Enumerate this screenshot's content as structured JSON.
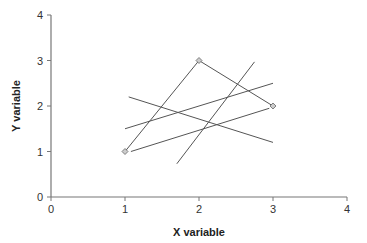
{
  "chart_data": {
    "type": "scatter",
    "title": "",
    "xlabel": "X variable",
    "ylabel": "Y variable",
    "xlim": [
      0,
      4
    ],
    "ylim": [
      0,
      4
    ],
    "xticks": [
      0,
      1,
      2,
      3,
      4
    ],
    "yticks": [
      0,
      1,
      2,
      3,
      4
    ],
    "grid": false,
    "legend": null,
    "points": [
      {
        "x": 1,
        "y": 1
      },
      {
        "x": 2,
        "y": 3
      },
      {
        "x": 3,
        "y": 2
      }
    ],
    "lines": [
      {
        "name": "triangle-edge-1",
        "x": [
          1,
          2
        ],
        "y": [
          1,
          3
        ]
      },
      {
        "name": "triangle-edge-2",
        "x": [
          2,
          3
        ],
        "y": [
          3,
          2
        ]
      },
      {
        "name": "line-a",
        "x": [
          1.0,
          3.0
        ],
        "y": [
          1.5,
          2.5
        ]
      },
      {
        "name": "line-b",
        "x": [
          1.05,
          3.0
        ],
        "y": [
          2.2,
          1.2
        ]
      },
      {
        "name": "line-c",
        "x": [
          1.7,
          2.75
        ],
        "y": [
          0.73,
          2.97
        ]
      },
      {
        "name": "line-d",
        "x": [
          1.08,
          2.95
        ],
        "y": [
          1.0,
          1.95
        ]
      }
    ]
  },
  "colors": {
    "line": "#555555",
    "axis": "#777777",
    "marker_fill": "#cccccc",
    "marker_stroke": "#666666"
  }
}
